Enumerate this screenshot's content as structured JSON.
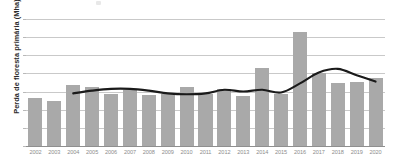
{
  "chart_data": {
    "type": "bar",
    "title": "",
    "subtitle": "",
    "xlabel": "",
    "ylabel": "Perda de floresta primária (Mha)",
    "ylim": [
      0,
      7
    ],
    "yticks": [
      0,
      1,
      2,
      3,
      4,
      5,
      6,
      7
    ],
    "ytick_labels": [
      "0",
      "1",
      "2",
      "3",
      "4",
      "5",
      "6",
      "7"
    ],
    "grid": true,
    "legend": "none",
    "categories": [
      "2002",
      "2003",
      "2004",
      "2005",
      "2006",
      "2007",
      "2008",
      "2009",
      "2010",
      "2011",
      "2012",
      "2013",
      "2014",
      "2015",
      "2016",
      "2017",
      "2018",
      "2019",
      "2020"
    ],
    "series": [
      {
        "name": "Perda de floresta primária",
        "type": "bar",
        "color": "#a9a9a9",
        "values": [
          2.65,
          2.5,
          3.35,
          3.25,
          2.85,
          3.1,
          2.8,
          2.85,
          3.25,
          2.85,
          3.15,
          2.75,
          4.3,
          2.85,
          6.3,
          4.0,
          3.5,
          3.55,
          3.75
        ]
      },
      {
        "name": "Tendência (média móvel)",
        "type": "line",
        "color": "#1a1a1a",
        "values": [
          null,
          null,
          2.9,
          3.05,
          3.15,
          3.15,
          3.05,
          2.9,
          2.85,
          2.9,
          3.1,
          3.0,
          3.1,
          2.95,
          3.45,
          4.05,
          4.25,
          3.9,
          3.55
        ]
      }
    ]
  },
  "axes": {
    "y_title": "Perda de floresta primária (Mha)"
  },
  "colors": {
    "bar": "#a9a9a9",
    "trend_line": "#1a1a1a",
    "gridline": "#c9c9c9",
    "axis": "#8f8f8f",
    "tick_text": "#8a8a8a",
    "label_text": "#2b2b2b",
    "background": "#ffffff"
  }
}
